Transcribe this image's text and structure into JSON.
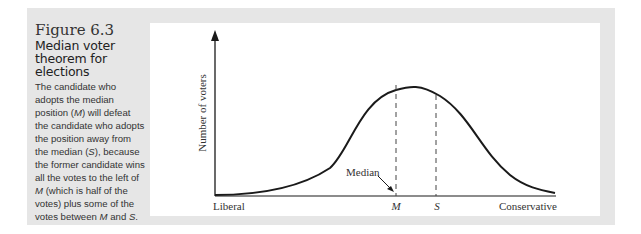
{
  "figure": {
    "number": "Figure 6.3",
    "title": "Median voter theorem for elections",
    "description_parts": [
      "The candidate who adopts the median position (",
      "M",
      ") will defeat the candidate who adopts the position away from the median (",
      "S",
      "), because the former candidate wins all the votes to the left of ",
      "M",
      " (which is half of the votes) plus some of the votes between ",
      "M",
      " and ",
      "S",
      "."
    ]
  },
  "diagram": {
    "y_axis_label": "Number of voters",
    "x_axis_left_label": "Liberal",
    "x_axis_right_label": "Conservative",
    "median_annotation": "Median",
    "marker_m": "M",
    "marker_s": "S",
    "curve_type": "bell-shaped distribution of voters",
    "colors": {
      "panel_background": "#e6e6e6",
      "plot_background": "#ffffff",
      "ink": "#1a1a1a"
    }
  }
}
